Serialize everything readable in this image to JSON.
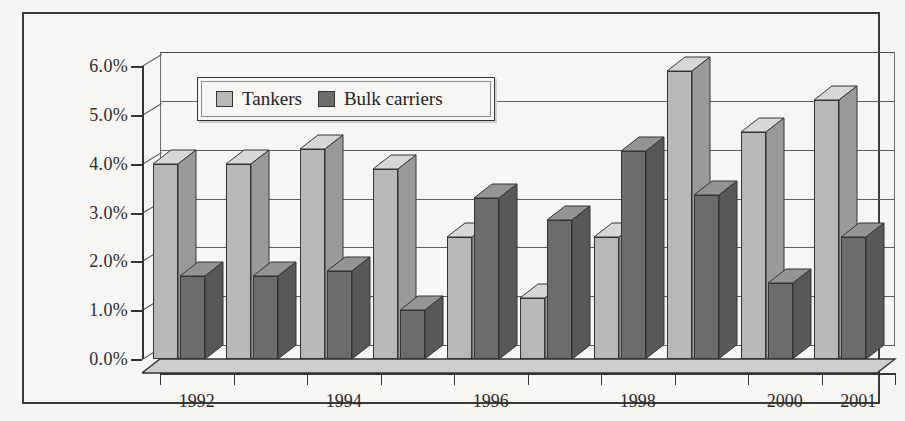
{
  "chart_data": {
    "type": "bar",
    "title": "",
    "subtitle": "",
    "xlabel": "",
    "ylabel": "",
    "categories": [
      "1992",
      "1993",
      "1994",
      "1995",
      "1996",
      "1997",
      "1998",
      "1999",
      "2000",
      "2001"
    ],
    "tick_labels_shown": [
      "1992",
      "1994",
      "1996",
      "1998",
      "2000",
      "2001"
    ],
    "series": [
      {
        "name": "Tankers",
        "values": [
          4.0,
          4.0,
          4.3,
          3.9,
          2.5,
          1.25,
          2.5,
          5.9,
          4.65,
          5.3
        ]
      },
      {
        "name": "Bulk carriers",
        "values": [
          1.7,
          1.7,
          1.8,
          1.0,
          3.3,
          2.85,
          4.25,
          3.35,
          1.55,
          2.5
        ]
      }
    ],
    "ylim": [
      0,
      6
    ],
    "ytick_values": [
      0.0,
      1.0,
      2.0,
      3.0,
      4.0,
      5.0,
      6.0
    ],
    "ytick_labels": [
      "0.0%",
      "1.0%",
      "2.0%",
      "3.0%",
      "4.0%",
      "5.0%",
      "6.0%"
    ],
    "value_unit": "%",
    "grid": true,
    "grid_axis": "y",
    "legend_position": "top-left-inside",
    "style": "3d-clustered-column",
    "colors": {
      "tankers": "#b9b9b4",
      "bulk_carriers": "#6d6d68",
      "outline": "#35352f",
      "gridline": "#5d5d5b",
      "background": "#f7f6f3"
    }
  },
  "legend": {
    "entries": [
      {
        "label": "Tankers",
        "swatch": "light-gray-swatch"
      },
      {
        "label": "Bulk carriers",
        "swatch": "dark-gray-swatch"
      }
    ]
  },
  "axes": {
    "y": {
      "labels": [
        "6.0%",
        "5.0%",
        "4.0%",
        "3.0%",
        "2.0%",
        "1.0%",
        "0.0%"
      ]
    },
    "x": {
      "labels": [
        "1992",
        "1994",
        "1996",
        "1998",
        "2000",
        "2001"
      ]
    }
  }
}
